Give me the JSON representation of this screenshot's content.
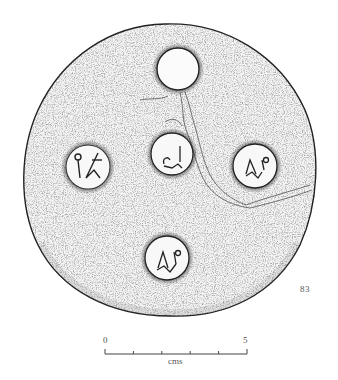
{
  "figure": {
    "number": "83",
    "stamps": [
      {
        "position": "top",
        "description": "plain circular impression"
      },
      {
        "position": "left",
        "description": "stamp with monogram/merchant mark"
      },
      {
        "position": "center",
        "description": "stamp with monogram"
      },
      {
        "position": "right",
        "description": "stamp with monogram"
      },
      {
        "position": "bottom",
        "description": "stamp with monogram"
      }
    ]
  },
  "scale_bar": {
    "start_label": "0",
    "end_label": "5",
    "unit": "cms",
    "ticks": 6
  },
  "colors": {
    "ink": "#222222",
    "background": "#ffffff"
  }
}
